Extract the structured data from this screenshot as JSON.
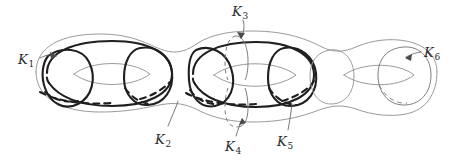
{
  "figure": {
    "type": "topological-surface-diagram",
    "background_color": "#ffffff",
    "bold_stroke_color": "#1f1f1f",
    "thin_stroke_color": "#9a9a9a",
    "label_color": "#2a2a2a",
    "genus": 3
  },
  "labels": [
    {
      "id": "K1",
      "base": "K",
      "sub": "1",
      "x": 18,
      "y": 53,
      "emphasis": "bold"
    },
    {
      "id": "K2",
      "base": "K",
      "sub": "2",
      "x": 155,
      "y": 133,
      "emphasis": "bold"
    },
    {
      "id": "K3",
      "base": "K",
      "sub": "3",
      "x": 232,
      "y": 5,
      "emphasis": "thin"
    },
    {
      "id": "K4",
      "base": "K",
      "sub": "4",
      "x": 225,
      "y": 140,
      "emphasis": "thin"
    },
    {
      "id": "K5",
      "base": "K",
      "sub": "5",
      "x": 277,
      "y": 135,
      "emphasis": "bold"
    },
    {
      "id": "K6",
      "base": "K",
      "sub": "6",
      "x": 424,
      "y": 46,
      "emphasis": "thin"
    }
  ],
  "curves": [
    {
      "name": "K1",
      "kind": "meridian",
      "handle": 1,
      "style": "bold-solid-with-dashed-back"
    },
    {
      "name": "K2",
      "kind": "longitude",
      "handle": 1,
      "style": "bold-solid-with-dashed-back"
    },
    {
      "name": "K3",
      "kind": "meridian-upper",
      "handle": 2,
      "style": "thin-solid-with-dashed-back"
    },
    {
      "name": "K4",
      "kind": "meridian-lower",
      "handle": 2,
      "style": "thin-solid-with-dashed-back"
    },
    {
      "name": "K5",
      "kind": "meridian",
      "handle": 2,
      "style": "bold-solid-with-dashed-back"
    },
    {
      "name": "K6",
      "kind": "meridian",
      "handle": 3,
      "style": "thin-solid-with-dashed-back"
    }
  ]
}
